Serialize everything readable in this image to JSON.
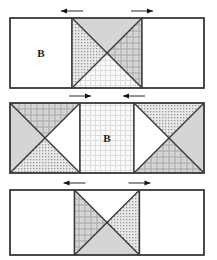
{
  "figure": {
    "title": "",
    "background": "#ffffff",
    "stroke_color": "#3a3a3a",
    "stroke_width": 1.4,
    "width": 217,
    "height": 260,
    "label_text": "B"
  },
  "palette": {
    "white": "#ffffff",
    "solid_gray": "#d5d5d5",
    "dot_fill": "#e8e8e8",
    "dot_ink": "#9a9a9a",
    "plaid_fill": "#dcdcdc",
    "plaid_ink": "#a8a8a8",
    "light_grid_fill": "#fafafa",
    "light_grid_ink": "#dddddd",
    "outline": "#3a3a3a",
    "arrow": "#111111"
  },
  "rows": [
    {
      "name": "row-top",
      "x": 10,
      "y": 18,
      "w": 194,
      "h": 70,
      "left_block": {
        "name": "left-rectangle",
        "fill": "white",
        "label": "B"
      },
      "center_block": {
        "name": "center-x-square",
        "triangles": {
          "top": "solid_gray",
          "left": "dot",
          "right": "plaid",
          "bottom": "light_grid"
        }
      },
      "right_block": {
        "name": "right-rectangle",
        "fill": "white",
        "label": ""
      },
      "arrows": [
        {
          "name": "arrow-left-pointing",
          "direction": "left"
        },
        {
          "name": "arrow-right-pointing",
          "direction": "right"
        }
      ]
    },
    {
      "name": "row-middle",
      "x": 10,
      "y": 103,
      "w": 194,
      "h": 70,
      "left_block": {
        "name": "left-x-square",
        "triangles": {
          "top": "plaid",
          "left": "solid_gray",
          "right": "white",
          "bottom": "dot"
        }
      },
      "center_block": {
        "name": "center-rectangle",
        "fill": "light_grid",
        "label": "B"
      },
      "right_block": {
        "name": "right-x-square",
        "triangles": {
          "top": "dot",
          "left": "white",
          "right": "solid_gray",
          "bottom": "plaid"
        }
      },
      "arrows": [
        {
          "name": "arrow-right-pointing",
          "direction": "right"
        },
        {
          "name": "arrow-left-pointing",
          "direction": "left"
        }
      ]
    },
    {
      "name": "row-bottom",
      "x": 10,
      "y": 190,
      "w": 194,
      "h": 65,
      "left_block": {
        "name": "left-rectangle",
        "fill": "white",
        "label": ""
      },
      "center_block": {
        "name": "center-x-square",
        "triangles": {
          "top": "white",
          "left": "plaid",
          "right": "dot",
          "bottom": "solid_gray"
        }
      },
      "right_block": {
        "name": "right-rectangle",
        "fill": "white",
        "label": ""
      },
      "arrows": [
        {
          "name": "arrow-left-pointing",
          "direction": "left"
        },
        {
          "name": "arrow-right-pointing",
          "direction": "right"
        }
      ]
    }
  ],
  "labels": {
    "row_top_label": "B",
    "row_middle_label": "B"
  }
}
